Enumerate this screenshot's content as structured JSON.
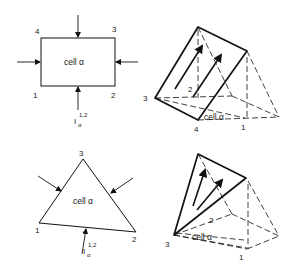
{
  "diagram": {
    "colors": {
      "stroke": "#111111",
      "text": "#222222",
      "background": "#ffffff"
    },
    "panels": [
      {
        "id": "rect-cell-2d",
        "cell_label": "cell α",
        "vertex_labels": {
          "v1": "1",
          "v2": "2",
          "v3": "3",
          "v4": "4"
        },
        "flux_label": {
          "base": "I",
          "sub": "α",
          "sup": "1,2"
        },
        "arrows": [
          "left",
          "top",
          "right",
          "bottom"
        ]
      },
      {
        "id": "prism-cell-3d",
        "cell_label": "cell α",
        "vertex_labels": {
          "v1": "1",
          "v2": "2",
          "v3": "3",
          "v4": "4"
        },
        "face_arrows": 2
      },
      {
        "id": "triangle-cell-2d",
        "cell_label": "cell α",
        "vertex_labels": {
          "v1": "1",
          "v2": "2",
          "v3": "3"
        },
        "flux_label": {
          "base": "I",
          "sub": "α",
          "sup": "1,2"
        },
        "arrows": [
          "upper-left",
          "upper-right",
          "bottom"
        ]
      },
      {
        "id": "tetra-cell-3d",
        "cell_label": "cell α",
        "vertex_labels": {
          "v1": "1",
          "v2": "2",
          "v3": "3"
        },
        "face_arrows": 2
      }
    ]
  }
}
